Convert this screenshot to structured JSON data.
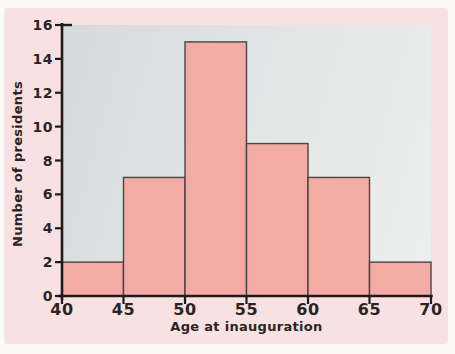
{
  "figure": {
    "page_background": "#fcfaf9",
    "panel_background": "#f8e1e2"
  },
  "chart_data": {
    "type": "bar",
    "subtype": "histogram",
    "title": "",
    "xlabel": "Age at inauguration",
    "ylabel": "Number of presidents",
    "bin_edges": [
      40,
      45,
      50,
      55,
      60,
      65,
      70
    ],
    "values": [
      2,
      7,
      15,
      9,
      7,
      2
    ],
    "xlim": [
      40,
      70
    ],
    "ylim": [
      0,
      16
    ],
    "xticks": [
      40,
      45,
      50,
      55,
      60,
      65,
      70
    ],
    "yticks": [
      0,
      2,
      4,
      6,
      8,
      10,
      12,
      14,
      16
    ],
    "grid": false,
    "legend": false,
    "bar_fill": "#f3aba5",
    "bar_stroke": "#4a4442",
    "axis_color": "#1d1b1a",
    "plot_background": "#e0e4e4",
    "tick_label_color": "#2a2522"
  }
}
